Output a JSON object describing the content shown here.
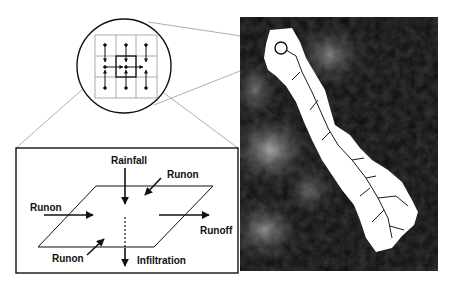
{
  "figure": {
    "type": "conceptual hydrology diagram",
    "zoom_inset": {
      "grid_rows": 3,
      "grid_cols": 3,
      "highlighted_cell": "center",
      "description": "3x3 grid of cells with flow arrows converging on central cell"
    },
    "cell_box": {
      "labels": {
        "rainfall": "Rainfall",
        "runon_top_right": "Runon",
        "runon_left": "Runon",
        "runon_bottom_left": "Runon",
        "runoff": "Runoff",
        "infiltration": "Infiltration"
      }
    },
    "map": {
      "description": "Grayscale elevation map with white catchment area and dark drainage network",
      "colors": {
        "background": "#0a0a0a",
        "catchment": "#ffffff",
        "terrain_light": "#9a9a9a"
      }
    },
    "colors": {
      "line": "#111111",
      "connector": "#9a9a9a",
      "grid": "#888888"
    }
  }
}
